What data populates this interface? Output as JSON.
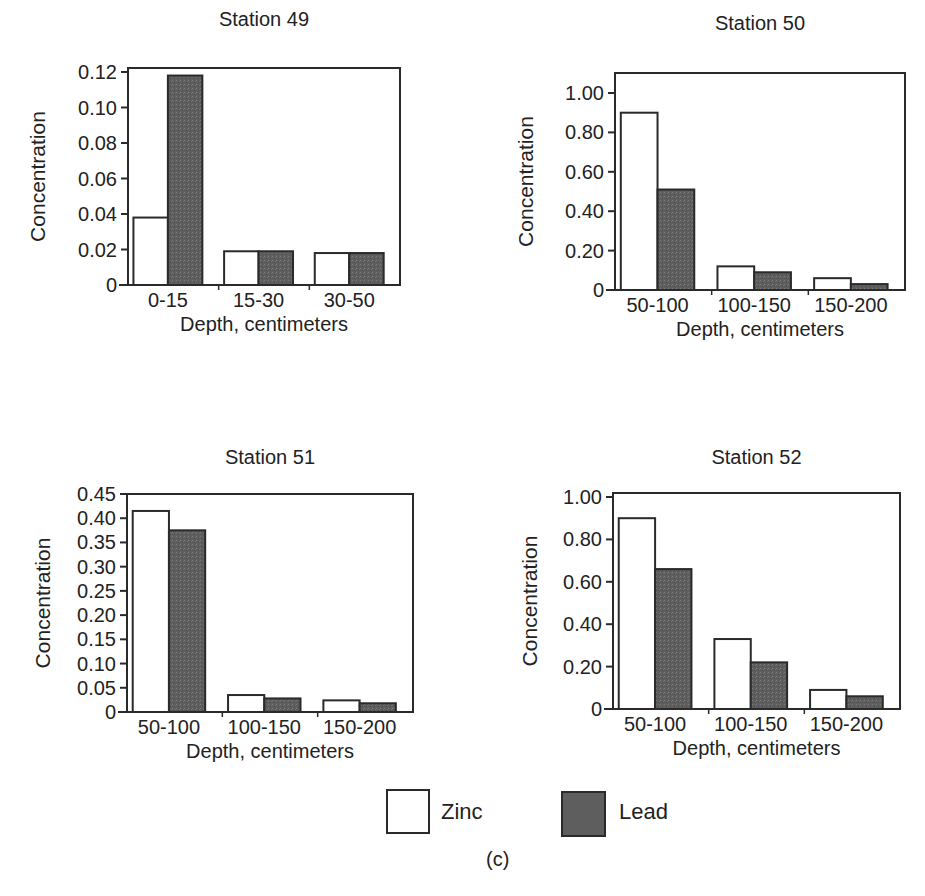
{
  "figure": {
    "caption": "(c)",
    "colors": {
      "zinc": "#ffffff",
      "lead": "#5e5e5e",
      "axis": "#2a2a2a",
      "text": "#222222"
    }
  },
  "legend": {
    "items": [
      {
        "label": "Zinc",
        "color": "#ffffff"
      },
      {
        "label": "Lead",
        "color": "#5e5e5e"
      }
    ]
  },
  "chart_data": [
    {
      "type": "bar",
      "title": "Station 49",
      "xlabel": "Depth, centimeters",
      "ylabel": "Concentration",
      "categories": [
        "0-15",
        "15-30",
        "30-50"
      ],
      "series": [
        {
          "name": "Zinc",
          "values": [
            0.038,
            0.019,
            0.018
          ]
        },
        {
          "name": "Lead",
          "values": [
            0.118,
            0.019,
            0.018
          ]
        }
      ],
      "yticks": [
        0,
        0.02,
        0.04,
        0.06,
        0.08,
        0.1,
        0.12
      ],
      "ytick_labels": [
        "0",
        "0.02",
        "0.04",
        "0.06",
        "0.08",
        "0.10",
        "0.12"
      ],
      "ylim": [
        0,
        0.12
      ],
      "grid": false,
      "legend_position": "bottom-shared"
    },
    {
      "type": "bar",
      "title": "Station 50",
      "xlabel": "Depth, centimeters",
      "ylabel": "Concentration",
      "categories": [
        "50-100",
        "100-150",
        "150-200"
      ],
      "series": [
        {
          "name": "Zinc",
          "values": [
            0.9,
            0.12,
            0.06
          ]
        },
        {
          "name": "Lead",
          "values": [
            0.51,
            0.09,
            0.03
          ]
        }
      ],
      "yticks": [
        0,
        0.2,
        0.4,
        0.6,
        0.8,
        1.0
      ],
      "ytick_labels": [
        "0",
        "0.20",
        "0.40",
        "0.60",
        "0.80",
        "1.00"
      ],
      "ylim": [
        0,
        1.1
      ],
      "grid": false,
      "legend_position": "bottom-shared"
    },
    {
      "type": "bar",
      "title": "Station 51",
      "xlabel": "Depth, centimeters",
      "ylabel": "Concentration",
      "categories": [
        "50-100",
        "100-150",
        "150-200"
      ],
      "series": [
        {
          "name": "Zinc",
          "values": [
            0.415,
            0.035,
            0.024
          ]
        },
        {
          "name": "Lead",
          "values": [
            0.375,
            0.028,
            0.018
          ]
        }
      ],
      "yticks": [
        0,
        0.05,
        0.1,
        0.15,
        0.2,
        0.25,
        0.3,
        0.35,
        0.4,
        0.45
      ],
      "ytick_labels": [
        "0",
        "0.05",
        "0.10",
        "0.15",
        "0.20",
        "0.25",
        "0.30",
        "0.35",
        "0.40",
        "0.45"
      ],
      "ylim": [
        0,
        0.45
      ],
      "grid": false,
      "legend_position": "bottom-shared"
    },
    {
      "type": "bar",
      "title": "Station 52",
      "xlabel": "Depth, centimeters",
      "ylabel": "Concentration",
      "categories": [
        "50-100",
        "100-150",
        "150-200"
      ],
      "series": [
        {
          "name": "Zinc",
          "values": [
            0.9,
            0.33,
            0.09
          ]
        },
        {
          "name": "Lead",
          "values": [
            0.66,
            0.22,
            0.06
          ]
        }
      ],
      "yticks": [
        0,
        0.2,
        0.4,
        0.6,
        0.8,
        1.0
      ],
      "ytick_labels": [
        "0",
        "0.20",
        "0.40",
        "0.60",
        "0.80",
        "1.00"
      ],
      "ylim": [
        0,
        1.02
      ],
      "grid": false,
      "legend_position": "bottom-shared"
    }
  ]
}
